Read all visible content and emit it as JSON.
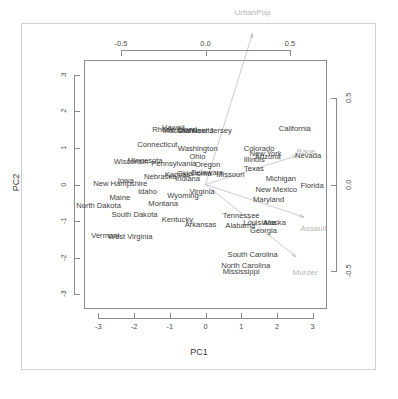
{
  "chart_data": {
    "type": "scatter",
    "title": "",
    "subtitle": "",
    "xlabel": "PC1",
    "ylabel": "PC2",
    "xlabel_top": "",
    "ylabel_right": "",
    "xlim": [
      -3.4,
      3.4
    ],
    "ylim": [
      -3.4,
      3.4
    ],
    "xlim_top": [
      -0.7194,
      0.7194
    ],
    "ylim_right": [
      -0.7194,
      0.7194
    ],
    "grid": false,
    "legend": "none",
    "x_ticks": [
      "-3",
      "-2",
      "-1",
      "0",
      "1",
      "2",
      "3"
    ],
    "x_tick_values": [
      -3,
      -2,
      -1,
      0,
      1,
      2,
      3
    ],
    "y_ticks": [
      "3",
      "2",
      "1",
      "0",
      "-1",
      "-2",
      "-3"
    ],
    "y_tick_values": [
      3,
      2,
      1,
      0,
      -1,
      -2,
      -3
    ],
    "x_ticks_top": [
      "-0.5",
      "0.0",
      "0.5"
    ],
    "x_tick_top_values": [
      -0.5,
      0.0,
      0.5
    ],
    "y_ticks_right": [
      "0.5",
      "0.0",
      "-0.5"
    ],
    "y_tick_right_values": [
      0.5,
      0.0,
      -0.5
    ],
    "point_labels": [
      {
        "label": "Alabama",
        "x": 0.9757,
        "y": -1.122
      },
      {
        "label": "Alaska",
        "x": 1.9305,
        "y": -1.0624
      },
      {
        "label": "Arizona",
        "x": 1.7454,
        "y": 0.7385
      },
      {
        "label": "Arkansas",
        "x": -0.14,
        "y": -1.1085
      },
      {
        "label": "California",
        "x": 2.4986,
        "y": 1.5274
      },
      {
        "label": "Colorado",
        "x": 1.4993,
        "y": 0.9776
      },
      {
        "label": "Connecticut",
        "x": -1.345,
        "y": 1.0778
      },
      {
        "label": "Delaware",
        "x": 0.0472,
        "y": 0.3221
      },
      {
        "label": "Florida",
        "x": 2.9828,
        "y": -0.0388
      },
      {
        "label": "Georgia",
        "x": 1.6228,
        "y": -1.2661
      },
      {
        "label": "Hawaii",
        "x": -0.9029,
        "y": 1.5501
      },
      {
        "label": "Idaho",
        "x": -1.6229,
        "y": -0.2097
      },
      {
        "label": "Illinois",
        "x": 1.3651,
        "y": 0.675
      },
      {
        "label": "Indiana",
        "x": -0.5005,
        "y": 0.1508
      },
      {
        "label": "Iowa",
        "x": -2.2317,
        "y": 0.1029
      },
      {
        "label": "Kansas",
        "x": -0.7889,
        "y": 0.2673
      },
      {
        "label": "Kentucky",
        "x": -0.7868,
        "y": -0.9585
      },
      {
        "label": "Louisiana",
        "x": 1.5094,
        "y": -1.0598
      },
      {
        "label": "Maine",
        "x": -2.3967,
        "y": -0.3764
      },
      {
        "label": "Maryland",
        "x": 1.7633,
        "y": -0.4278
      },
      {
        "label": "Massachusetts",
        "x": -0.4864,
        "y": 1.4744
      },
      {
        "label": "Michigan",
        "x": 2.1082,
        "y": 0.1554
      },
      {
        "label": "Minnesota",
        "x": -1.692,
        "y": 0.6325
      },
      {
        "label": "Mississippi",
        "x": 0.9962,
        "y": -2.3937
      },
      {
        "label": "Missouri",
        "x": 0.6968,
        "y": 0.2634
      },
      {
        "label": "Montana",
        "x": -1.1855,
        "y": -0.5369
      },
      {
        "label": "Nebraska",
        "x": -1.2657,
        "y": 0.194
      },
      {
        "label": "Nevada",
        "x": 2.8744,
        "y": 0.7756
      },
      {
        "label": "New Hampshire",
        "x": -2.3836,
        "y": 0.0181
      },
      {
        "label": "New Jersey",
        "x": 0.1811,
        "y": 1.4493
      },
      {
        "label": "New Mexico",
        "x": 1.98,
        "y": -0.1428
      },
      {
        "label": "New York",
        "x": 1.6827,
        "y": 0.823
      },
      {
        "label": "North Carolina",
        "x": 1.1235,
        "y": -2.228
      },
      {
        "label": "North Dakota",
        "x": -2.9922,
        "y": -0.5991
      },
      {
        "label": "Ohio",
        "x": -0.2257,
        "y": 0.7423
      },
      {
        "label": "Oklahoma",
        "x": -0.3119,
        "y": 0.2878
      },
      {
        "label": "Oregon",
        "x": 0.0591,
        "y": 0.5414
      },
      {
        "label": "Pennsylvania",
        "x": -0.8889,
        "y": 0.5711
      },
      {
        "label": "Rhode Island",
        "x": -0.8637,
        "y": 1.492
      },
      {
        "label": "South Carolina",
        "x": 1.3207,
        "y": -1.933
      },
      {
        "label": "South Dakota",
        "x": -1.9876,
        "y": -0.8235
      },
      {
        "label": "Tennessee",
        "x": 0.9997,
        "y": -0.8603
      },
      {
        "label": "Texas",
        "x": 1.3551,
        "y": 0.4125
      },
      {
        "label": "Utah",
        "x": -0.5507,
        "y": 1.4715
      },
      {
        "label": "Vermont",
        "x": -2.8013,
        "y": -1.4023
      },
      {
        "label": "Virginia",
        "x": -0.0963,
        "y": -0.1996
      },
      {
        "label": "Washington",
        "x": -0.2169,
        "y": 0.9704
      },
      {
        "label": "West Virginia",
        "x": -2.1086,
        "y": -1.4248
      },
      {
        "label": "Wisconsin",
        "x": -2.0797,
        "y": 0.6113
      },
      {
        "label": "Wyoming",
        "x": -0.6291,
        "y": -0.3212
      }
    ],
    "loading_vectors": [
      {
        "label": "Murder",
        "x": 0.5359,
        "y": -0.4182,
        "label_x": 0.59,
        "label_y": -0.51
      },
      {
        "label": "Assault",
        "x": 0.5832,
        "y": -0.188,
        "label_x": 0.64,
        "label_y": -0.26
      },
      {
        "label": "UrbanPop",
        "x": 0.2782,
        "y": 0.8728,
        "label_x": 0.2782,
        "label_y": 0.99
      },
      {
        "label": "Rape",
        "x": 0.5434,
        "y": 0.1673,
        "label_x": 0.595,
        "label_y": 0.19
      }
    ]
  },
  "colors": {
    "point_label": "#3d3d3d",
    "vector_label": "#b5b5b5",
    "arrow": "#b5b5b5",
    "axis": "#8c8c8c",
    "frame": "#cfcfcf",
    "background": "#ffffff"
  }
}
